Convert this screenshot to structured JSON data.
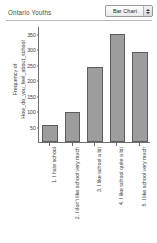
{
  "header": {
    "title": "Ontario Youths",
    "chart_type_selected": "Bar Chart",
    "stepper_up_icon": "triangle-up-icon",
    "stepper_down_icon": "triangle-down-icon"
  },
  "chart_data": {
    "type": "bar",
    "title": "Ontario Youths",
    "xlabel": "",
    "ylabel": "Frequency of How_do_you_feel_about_school",
    "ylabel_lines": [
      "Frequency of",
      "How_do_you_feel_about_school"
    ],
    "categories": [
      "1. I hate school",
      "2. I don't like school very much",
      "3. I like school a bit",
      "4. I like school quite a bit",
      "5. I like school very much"
    ],
    "values": [
      55,
      98,
      242,
      348,
      290
    ],
    "ylim": [
      0,
      375
    ],
    "yticks": [
      50,
      100,
      150,
      200,
      250,
      300,
      350
    ],
    "grid": false,
    "legend": "none",
    "bar_color": "#9d9d9d",
    "bar_border_color": "#5d5d5d",
    "axis_color": "#6e6e6e",
    "text_color": "#3d3d3d",
    "background": "#ffffff"
  }
}
